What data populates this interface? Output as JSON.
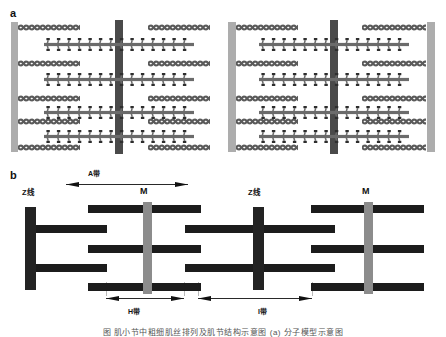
{
  "figure": {
    "panels": [
      {
        "letter": "a",
        "name": "molecular-filament-panel"
      },
      {
        "letter": "b",
        "name": "schematic-band-panel"
      }
    ],
    "caption": "图 肌小节中粗细肌丝排列及肌节结构示意图 (a) 分子模型示意图"
  },
  "panel_a": {
    "letter": "a",
    "z_lines": [
      {
        "name": "z-line-left",
        "x": 11,
        "width": 7
      },
      {
        "name": "z-line-middle",
        "x": 228,
        "width": 8
      },
      {
        "name": "z-line-right",
        "x": 427,
        "width": 8
      }
    ],
    "m_lines": [
      {
        "name": "m-line-left",
        "x": 115,
        "width": 8
      },
      {
        "name": "m-line-right",
        "x": 330,
        "width": 8
      }
    ],
    "thin_filaments": [
      {
        "x": 18,
        "width": 62,
        "y": 6
      },
      {
        "x": 148,
        "width": 62,
        "y": 6
      },
      {
        "x": 236,
        "width": 62,
        "y": 6
      },
      {
        "x": 362,
        "width": 64,
        "y": 6
      },
      {
        "x": 18,
        "width": 62,
        "y": 42
      },
      {
        "x": 148,
        "width": 62,
        "y": 42
      },
      {
        "x": 236,
        "width": 62,
        "y": 42
      },
      {
        "x": 362,
        "width": 64,
        "y": 42
      },
      {
        "x": 18,
        "width": 62,
        "y": 77
      },
      {
        "x": 148,
        "width": 62,
        "y": 77
      },
      {
        "x": 236,
        "width": 62,
        "y": 77
      },
      {
        "x": 362,
        "width": 64,
        "y": 77
      },
      {
        "x": 18,
        "width": 62,
        "y": 100
      },
      {
        "x": 148,
        "width": 62,
        "y": 100
      },
      {
        "x": 236,
        "width": 62,
        "y": 100
      },
      {
        "x": 362,
        "width": 64,
        "y": 100
      },
      {
        "x": 18,
        "width": 62,
        "y": 126
      },
      {
        "x": 148,
        "width": 62,
        "y": 126
      },
      {
        "x": 236,
        "width": 62,
        "y": 126
      },
      {
        "x": 362,
        "width": 64,
        "y": 126
      }
    ],
    "thick_filaments": [
      {
        "x": 44,
        "width": 150,
        "y": 20
      },
      {
        "x": 259,
        "width": 150,
        "y": 20
      },
      {
        "x": 44,
        "width": 150,
        "y": 55
      },
      {
        "x": 259,
        "width": 150,
        "y": 55
      },
      {
        "x": 44,
        "width": 150,
        "y": 88
      },
      {
        "x": 259,
        "width": 150,
        "y": 88
      },
      {
        "x": 44,
        "width": 150,
        "y": 112
      },
      {
        "x": 259,
        "width": 150,
        "y": 112
      }
    ]
  },
  "panel_b": {
    "letter": "b",
    "labels": [
      {
        "name": "z-line-label-left",
        "text": "Z线",
        "x": 22,
        "y": 29
      },
      {
        "name": "m-line-label-left",
        "text": "M",
        "x": 140,
        "y": 27
      },
      {
        "name": "z-line-label-right",
        "text": "Z线",
        "x": 248,
        "y": 29
      },
      {
        "name": "m-line-label-right",
        "text": "M",
        "x": 362,
        "y": 27
      }
    ],
    "bands": [
      {
        "name": "a-band",
        "text": "A带",
        "x": 88,
        "y": 10,
        "arrow_x": 66,
        "arrow_width": 122,
        "arrow_y": 20,
        "label_above": true
      },
      {
        "name": "h-band",
        "text": "H带",
        "x": 128,
        "y": 148,
        "arrow_x": 106,
        "arrow_width": 78,
        "arrow_y": 134,
        "label_above": false
      },
      {
        "name": "i-band",
        "text": "I带",
        "x": 258,
        "y": 148,
        "arrow_x": 198,
        "arrow_width": 114,
        "arrow_y": 134,
        "label_above": false
      }
    ],
    "z_lines": [
      {
        "name": "b-z-line-left",
        "x": 25,
        "width": 11
      },
      {
        "name": "b-z-line-right",
        "x": 253,
        "width": 11
      }
    ],
    "m_lines": [
      {
        "name": "b-m-line-left",
        "x": 143,
        "width": 9
      },
      {
        "name": "b-m-line-right",
        "x": 364,
        "width": 9
      }
    ],
    "bars": [
      {
        "x": 88,
        "width": 113,
        "y": 45
      },
      {
        "x": 311,
        "width": 113,
        "y": 45
      },
      {
        "x": 36,
        "width": 71,
        "y": 65
      },
      {
        "x": 185,
        "width": 79,
        "y": 65
      },
      {
        "x": 264,
        "width": 71,
        "y": 65
      },
      {
        "x": 88,
        "width": 113,
        "y": 85
      },
      {
        "x": 311,
        "width": 113,
        "y": 85
      },
      {
        "x": 36,
        "width": 71,
        "y": 104
      },
      {
        "x": 185,
        "width": 79,
        "y": 104
      },
      {
        "x": 264,
        "width": 71,
        "y": 104
      },
      {
        "x": 88,
        "width": 113,
        "y": 123
      },
      {
        "x": 311,
        "width": 113,
        "y": 123
      }
    ],
    "ticks": [
      {
        "x": 106,
        "y": 122,
        "height": 14
      },
      {
        "x": 184,
        "y": 122,
        "height": 14
      },
      {
        "x": 198,
        "y": 122,
        "height": 14
      },
      {
        "x": 312,
        "y": 122,
        "height": 14
      }
    ]
  }
}
